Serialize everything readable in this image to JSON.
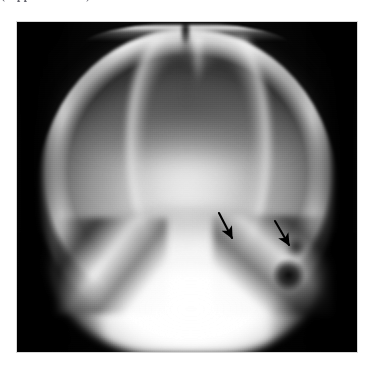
{
  "page": {
    "background_color": "#ffffff",
    "width": 377,
    "height": 369
  },
  "clipped_caption": {
    "text": "(clipped text line)",
    "note": "only the bottom 1-2 pixel rows of a bold serif text line remain visible at the very top edge",
    "color": "#4a4a55"
  },
  "figure": {
    "kind": "radiograph",
    "view": "skull-ap-townes-view",
    "frame": {
      "x": 17,
      "y": 22,
      "width": 340,
      "height": 330
    },
    "background_color": "#000000",
    "annotations": [
      {
        "name": "arrow-left",
        "label": "arrow-1",
        "color": "#000000",
        "tail": {
          "x": 219,
          "y": 213
        },
        "tip": {
          "x": 232,
          "y": 238
        },
        "direction": "down-right"
      },
      {
        "name": "arrow-right",
        "label": "arrow-2",
        "color": "#000000",
        "tail": {
          "x": 275,
          "y": 221
        },
        "tip": {
          "x": 289,
          "y": 245
        },
        "direction": "down-right"
      }
    ],
    "anatomy_landmarks": [
      {
        "name": "cranial-vault",
        "description": "gray dome of the calvarium"
      },
      {
        "name": "sagittal-suture-notch",
        "description": "dark vertical notch at the vertex"
      },
      {
        "name": "inner-table-rim",
        "description": "bright arc along the vault margin"
      },
      {
        "name": "central-lucency",
        "description": "bright lucent field indicated by the arrows"
      },
      {
        "name": "skull-base",
        "description": "dense white mass of the skull base and petrous bones"
      },
      {
        "name": "mastoid-air-cells",
        "description": "dark lucent blob on the right side of the skull base"
      }
    ]
  }
}
